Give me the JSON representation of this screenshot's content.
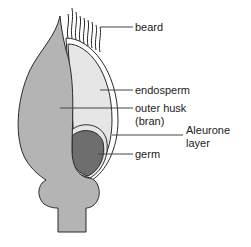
{
  "diagram": {
    "labels": {
      "beard": "beard",
      "endosperm": "endosperm",
      "outer_husk_line1": "outer husk",
      "outer_husk_line2": "(bran)",
      "aleurone_line1": "Aleurone",
      "aleurone_line2": "layer",
      "germ": "germ"
    },
    "colors": {
      "husk": "#b4b4b4",
      "endosperm": "#e6e6e6",
      "germ": "#6e6e6e",
      "outline": "#2a2a2a",
      "leader_line": "#444444"
    }
  }
}
